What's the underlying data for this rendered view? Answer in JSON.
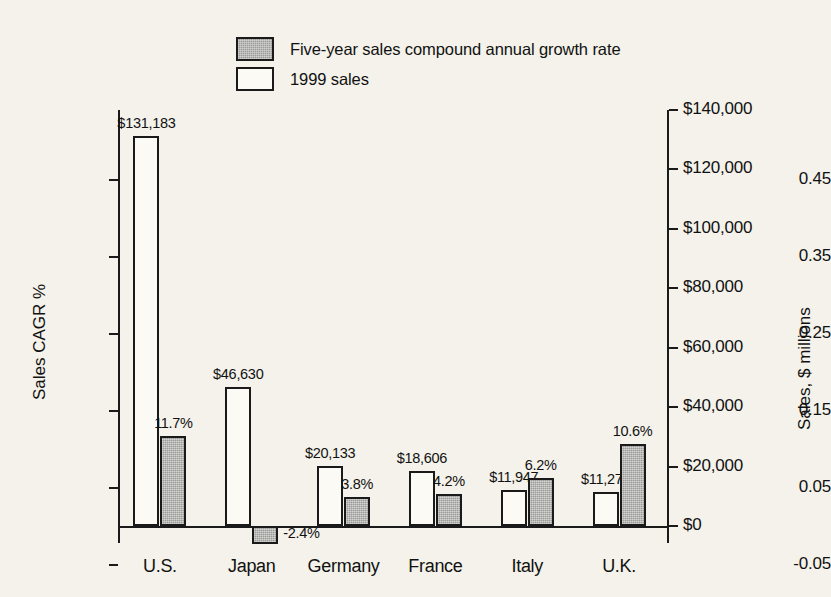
{
  "chart_data": {
    "type": "bar",
    "title": "",
    "categories": [
      "U.S.",
      "Japan",
      "Germany",
      "France",
      "Italy",
      "U.K."
    ],
    "series": [
      {
        "name": "Five-year sales compound annual growth rate",
        "axis": "left",
        "values": [
          0.117,
          -0.024,
          0.038,
          0.042,
          0.062,
          0.106
        ],
        "value_labels": [
          "11.7%",
          "-2.4%",
          "3.8%",
          "4.2%",
          "6.2%",
          "10.6%"
        ],
        "style": "filled"
      },
      {
        "name": "1999 sales",
        "axis": "right",
        "values": [
          131183,
          46630,
          20133,
          18606,
          11947,
          11271
        ],
        "value_labels": [
          "$131,183",
          "$46,630",
          "$20,133",
          "$18,606",
          "$11,947",
          "$11,271"
        ],
        "style": "hollow"
      }
    ],
    "xlabel": "",
    "ylabel": "Sales CAGR %",
    "y2label": "Sales, $ millions",
    "ylim": [
      -0.05,
      0.5
    ],
    "y2lim": [
      0,
      147000
    ],
    "yticks": [
      0.45,
      0.35,
      0.25,
      0.15,
      0.05,
      -0.05
    ],
    "ytick_labels": [
      "0.45",
      "0.35",
      "0.25",
      "0.15",
      "0.05",
      "-0.05"
    ],
    "y2ticks": [
      140000,
      120000,
      100000,
      80000,
      60000,
      40000,
      20000,
      0
    ],
    "y2tick_labels": [
      "$140,000",
      "$120,000",
      "$100,000",
      "$80,000",
      "$60,000",
      "$40,000",
      "$20,000",
      "$0"
    ],
    "grid": false,
    "legend_position": "top-center"
  },
  "legend": {
    "items": [
      {
        "label": "Five-year sales compound annual growth rate",
        "style": "filled"
      },
      {
        "label": "1999 sales",
        "style": "hollow"
      }
    ]
  },
  "axes": {
    "left_title": "Sales CAGR %",
    "right_title": "Sales, $ millions",
    "left_ticks": [
      "0.45",
      "0.35",
      "0.25",
      "0.15",
      "0.05",
      "-0.05"
    ],
    "right_ticks": [
      "$140,000",
      "$120,000",
      "$100,000",
      "$80,000",
      "$60,000",
      "$40,000",
      "$20,000",
      "$0"
    ]
  }
}
